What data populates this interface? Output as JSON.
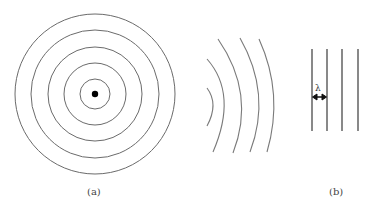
{
  "figure": {
    "panel_a": {
      "caption": "(a)",
      "description": "Concentric circular wavefronts around a point source",
      "center": [
        95,
        94
      ],
      "ring_radii": [
        15,
        31,
        47,
        64,
        80
      ]
    },
    "arcs": {
      "description": "Curved wavefronts becoming flatter with distance",
      "count": 4
    },
    "panel_b": {
      "caption": "(b)",
      "description": "Plane wavefronts separated by wavelength",
      "wavelength_label": "λ",
      "line_x": [
        312,
        327,
        342,
        358
      ]
    },
    "colors": {
      "line": "#6b6b6b",
      "source_dot": "#000000",
      "plane_line": "#4a4a4a"
    }
  }
}
